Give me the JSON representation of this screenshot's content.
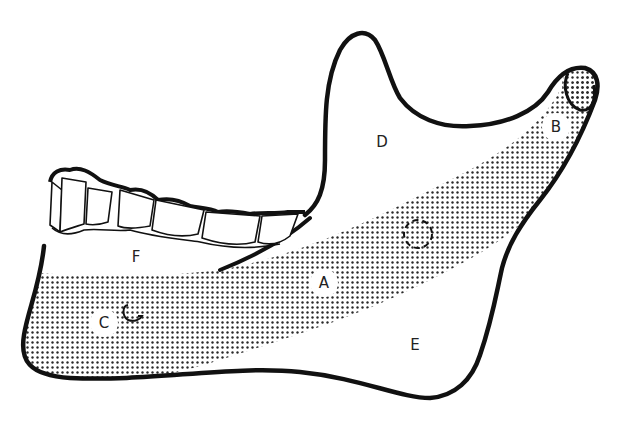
{
  "figure": {
    "labels": [
      {
        "id": "A",
        "text": "A",
        "x": 324,
        "y": 283
      },
      {
        "id": "B",
        "text": "B",
        "x": 556,
        "y": 127
      },
      {
        "id": "C",
        "text": "C",
        "x": 104,
        "y": 323
      },
      {
        "id": "D",
        "text": "D",
        "x": 382,
        "y": 142
      },
      {
        "id": "E",
        "text": "E",
        "x": 415,
        "y": 345
      },
      {
        "id": "F",
        "text": "F",
        "x": 136,
        "y": 257
      }
    ],
    "colors": {
      "outline": "#111111",
      "stipple": "#2a2a2a",
      "background": "#ffffff"
    }
  }
}
